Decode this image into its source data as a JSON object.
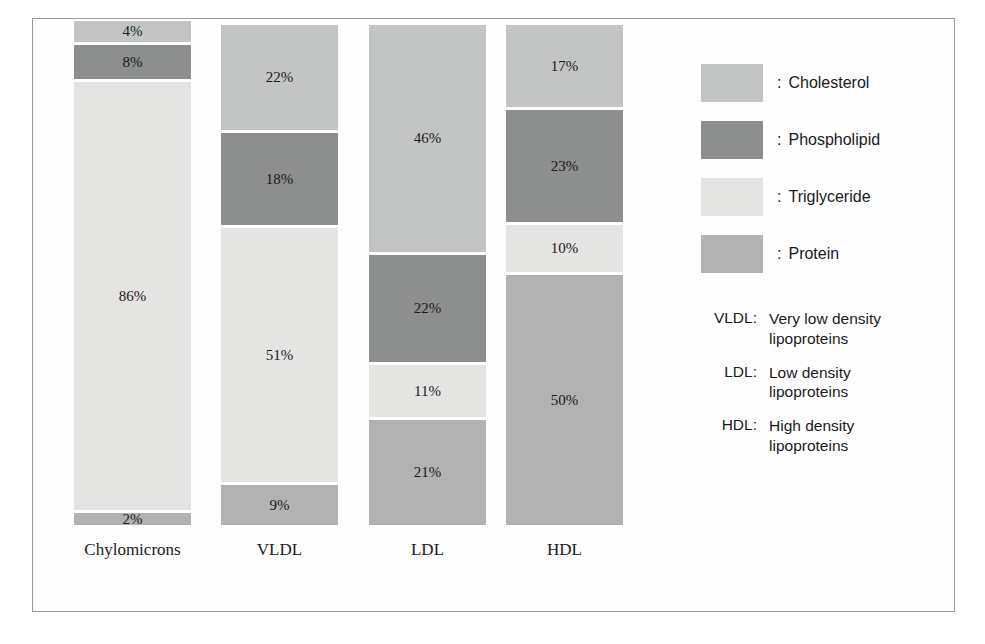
{
  "chart_data": {
    "type": "bar",
    "subtype": "stacked-percentage",
    "title": "",
    "xlabel": "",
    "ylabel": "",
    "ylim": [
      0,
      100
    ],
    "grid": false,
    "legend_position": "right",
    "categories": [
      "Chylomicrons",
      "VLDL",
      "LDL",
      "HDL"
    ],
    "series": [
      {
        "name": "Cholesterol",
        "values": [
          4,
          22,
          46,
          17
        ],
        "color": "#c3c4c4"
      },
      {
        "name": "Phospholipid",
        "values": [
          8,
          18,
          22,
          23
        ],
        "color": "#8d8e8e"
      },
      {
        "name": "Triglyceride",
        "values": [
          86,
          51,
          11,
          10
        ],
        "color": "#e4e4e3"
      },
      {
        "name": "Protein",
        "values": [
          2,
          9,
          21,
          50
        ],
        "color": "#b1b2b1"
      }
    ],
    "value_suffix": "%",
    "stack_order_top_to_bottom": [
      "Cholesterol",
      "Phospholipid",
      "Triglyceride",
      "Protein"
    ]
  },
  "columns": [
    {
      "name": "Chylomicrons",
      "label": "Chylomicrons",
      "total_height_px": 507,
      "segments": [
        {
          "series": "Cholesterol",
          "label": "4%",
          "value": 4,
          "height_px": 24,
          "color": "#c3c4c4"
        },
        {
          "series": "Phospholipid",
          "label": "8%",
          "value": 8,
          "height_px": 37,
          "color": "#8d8e8e"
        },
        {
          "series": "Triglyceride",
          "label": "86%",
          "value": 86,
          "height_px": 431,
          "color": "#e4e4e3"
        },
        {
          "series": "Protein",
          "label": "2%",
          "value": 2,
          "height_px": 15,
          "color": "#b1b2b1"
        }
      ]
    },
    {
      "name": "VLDL",
      "label": "VLDL",
      "total_height_px": 503,
      "segments": [
        {
          "series": "Cholesterol",
          "label": "22%",
          "value": 22,
          "height_px": 108,
          "color": "#c3c4c4"
        },
        {
          "series": "Phospholipid",
          "label": "18%",
          "value": 18,
          "height_px": 95,
          "color": "#8d8e8e"
        },
        {
          "series": "Triglyceride",
          "label": "51%",
          "value": 51,
          "height_px": 257,
          "color": "#e4e4e3"
        },
        {
          "series": "Protein",
          "label": "9%",
          "value": 9,
          "height_px": 43,
          "color": "#b1b2b1"
        }
      ]
    },
    {
      "name": "LDL",
      "label": "LDL",
      "total_height_px": 503,
      "segments": [
        {
          "series": "Cholesterol",
          "label": "46%",
          "value": 46,
          "height_px": 230,
          "color": "#c3c4c4"
        },
        {
          "series": "Phospholipid",
          "label": "22%",
          "value": 22,
          "height_px": 110,
          "color": "#8d8e8e"
        },
        {
          "series": "Triglyceride",
          "label": "11%",
          "value": 11,
          "height_px": 55,
          "color": "#e4e4e3"
        },
        {
          "series": "Protein",
          "label": "21%",
          "value": 21,
          "height_px": 108,
          "color": "#b1b2b1"
        }
      ]
    },
    {
      "name": "HDL",
      "label": "HDL",
      "total_height_px": 503,
      "segments": [
        {
          "series": "Cholesterol",
          "label": "17%",
          "value": 17,
          "height_px": 85,
          "color": "#c3c4c4"
        },
        {
          "series": "Phospholipid",
          "label": "23%",
          "value": 23,
          "height_px": 115,
          "color": "#8d8e8e"
        },
        {
          "series": "Triglyceride",
          "label": "10%",
          "value": 10,
          "height_px": 50,
          "color": "#e4e4e3"
        },
        {
          "series": "Protein",
          "label": "50%",
          "value": 50,
          "height_px": 253,
          "color": "#b1b2b1"
        }
      ]
    }
  ],
  "legend": {
    "separator": ":",
    "items": [
      {
        "label": "Cholesterol",
        "color": "#c3c4c4"
      },
      {
        "label": "Phospholipid",
        "color": "#8d8e8e"
      },
      {
        "label": "Triglyceride",
        "color": "#e4e4e3"
      },
      {
        "label": "Protein",
        "color": "#b1b2b1"
      }
    ]
  },
  "abbreviations": [
    {
      "key": "VLDL:",
      "line1": "Very low density",
      "line2": "lipoproteins"
    },
    {
      "key": "LDL:",
      "line1": "Low density",
      "line2": "lipoproteins"
    },
    {
      "key": "HDL:",
      "line1": "High density",
      "line2": "lipoproteins"
    }
  ]
}
